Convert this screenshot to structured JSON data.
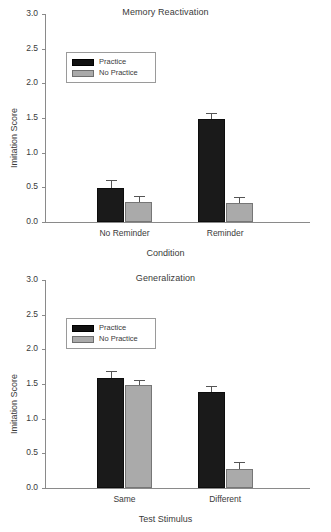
{
  "figure": {
    "width": 331,
    "height": 532,
    "series_colors": {
      "practice": "#1a1a1a",
      "no_practice": "#aaaaaa",
      "axis": "#8a8a8a",
      "text": "#3a3a3a",
      "background": "#ffffff"
    }
  },
  "chart_data": [
    {
      "type": "bar",
      "title": "Memory Reactivation",
      "xlabel": "Condition",
      "ylabel": "Imitation Score",
      "categories": [
        "No Reminder",
        "Reminder"
      ],
      "ylim": [
        0.0,
        3.0
      ],
      "yticks": [
        "0.0",
        "0.5",
        "1.0",
        "1.5",
        "2.0",
        "2.5",
        "3.0"
      ],
      "ytick_values": [
        0.0,
        0.5,
        1.0,
        1.5,
        2.0,
        2.5,
        3.0
      ],
      "grid": false,
      "legend_position": "upper left",
      "error_bars": "upper-only (SEM)",
      "series": [
        {
          "name": "Practice",
          "values": [
            0.49,
            1.48
          ],
          "errors": [
            0.11,
            0.09
          ]
        },
        {
          "name": "No Practice",
          "values": [
            0.29,
            0.27
          ],
          "errors": [
            0.08,
            0.09
          ]
        }
      ]
    },
    {
      "type": "bar",
      "title": "Generalization",
      "xlabel": "Test Stimulus",
      "ylabel": "Imitation Score",
      "categories": [
        "Same",
        "Different"
      ],
      "ylim": [
        0.0,
        3.0
      ],
      "yticks": [
        "0.0",
        "0.5",
        "1.0",
        "1.5",
        "2.0",
        "2.5",
        "3.0"
      ],
      "ytick_values": [
        0.0,
        0.5,
        1.0,
        1.5,
        2.0,
        2.5,
        3.0
      ],
      "grid": false,
      "legend_position": "upper left",
      "error_bars": "upper-only (SEM)",
      "series": [
        {
          "name": "Practice",
          "values": [
            1.58,
            1.38
          ],
          "errors": [
            0.11,
            0.09
          ]
        },
        {
          "name": "No Practice",
          "values": [
            1.48,
            0.27
          ],
          "errors": [
            0.08,
            0.1
          ]
        }
      ]
    }
  ]
}
